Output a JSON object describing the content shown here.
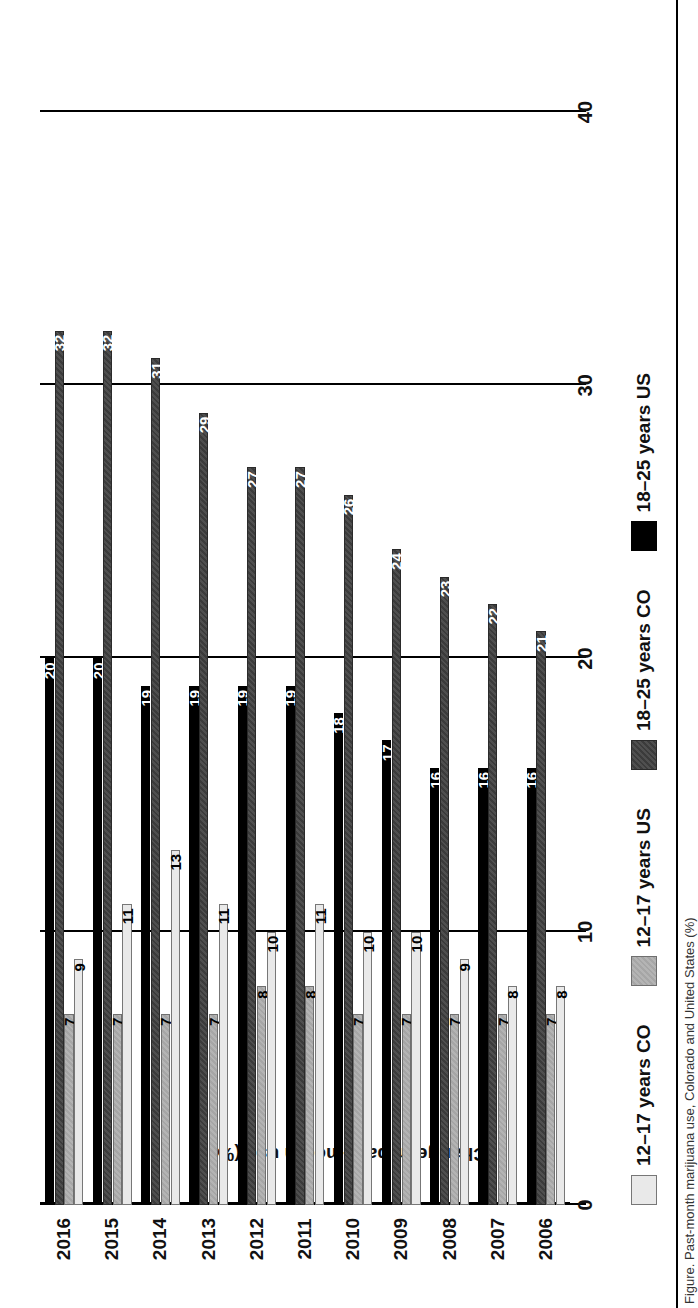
{
  "figure": {
    "ylabel": "Change in past-month use (%)",
    "caption": "Figure. Past-month marijuana use, Colorado and United States (%)"
  },
  "axis": {
    "ticks": [
      "0",
      "10",
      "20",
      "30",
      "40"
    ],
    "tick_values": [
      0,
      10,
      20,
      30,
      40
    ],
    "max": 40
  },
  "legend": {
    "items": [
      {
        "label": "12–17 years CO",
        "key": "s1217co",
        "color": "#e9e9e9"
      },
      {
        "label": "12–17 years US",
        "key": "s1217us",
        "color": "#a6a6a6"
      },
      {
        "label": "18–25 years CO",
        "key": "s1825co",
        "color": "#3b3b3b"
      },
      {
        "label": "18–25 years US",
        "key": "s1825us",
        "color": "#000000"
      }
    ]
  },
  "chart_data": {
    "type": "bar",
    "title": "",
    "xlabel": "",
    "ylabel": "Change in past-month use (%)",
    "ylim": [
      0,
      40
    ],
    "grid": true,
    "orientation": "horizontal-grouped",
    "legend_position": "bottom",
    "categories": [
      "2006",
      "2007",
      "2008",
      "2009",
      "2010",
      "2011",
      "2012",
      "2013",
      "2014",
      "2015",
      "2016"
    ],
    "series": [
      {
        "name": "12–17 years CO",
        "key": "s1217co",
        "color": "#e9e9e9",
        "values": [
          8,
          8,
          9,
          10,
          10,
          11,
          10,
          11,
          13,
          11,
          9
        ]
      },
      {
        "name": "12–17 years US",
        "key": "s1217us",
        "color": "#a6a6a6",
        "values": [
          7,
          7,
          7,
          7,
          7,
          8,
          8,
          7,
          7,
          7,
          7
        ]
      },
      {
        "name": "18–25 years CO",
        "key": "s1825co",
        "color": "#3b3b3b",
        "values": [
          21,
          22,
          23,
          24,
          26,
          27,
          27,
          29,
          31,
          32,
          32
        ]
      },
      {
        "name": "18–25 years US",
        "key": "s1825us",
        "color": "#000000",
        "values": [
          16,
          16,
          16,
          17,
          18,
          19,
          19,
          19,
          19,
          20,
          20
        ]
      }
    ]
  }
}
